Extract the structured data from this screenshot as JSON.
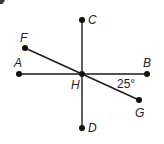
{
  "diagram": {
    "type": "geometry-lines",
    "points": {
      "A": {
        "label": "A"
      },
      "B": {
        "label": "B"
      },
      "C": {
        "label": "C"
      },
      "D": {
        "label": "D"
      },
      "F": {
        "label": "F"
      },
      "G": {
        "label": "G"
      },
      "H": {
        "label": "H"
      }
    },
    "segments": [
      {
        "from": "A",
        "to": "B",
        "name": "line-ab"
      },
      {
        "from": "C",
        "to": "D",
        "name": "line-cd"
      },
      {
        "from": "F",
        "to": "G",
        "name": "line-fg"
      }
    ],
    "angle_annotation": {
      "vertex": "H",
      "between": [
        "B",
        "G"
      ],
      "text": "25°"
    },
    "colors": {
      "line": "#1a1a1a",
      "point": "#111111",
      "text": "#222222",
      "background": "#ffffff"
    }
  }
}
